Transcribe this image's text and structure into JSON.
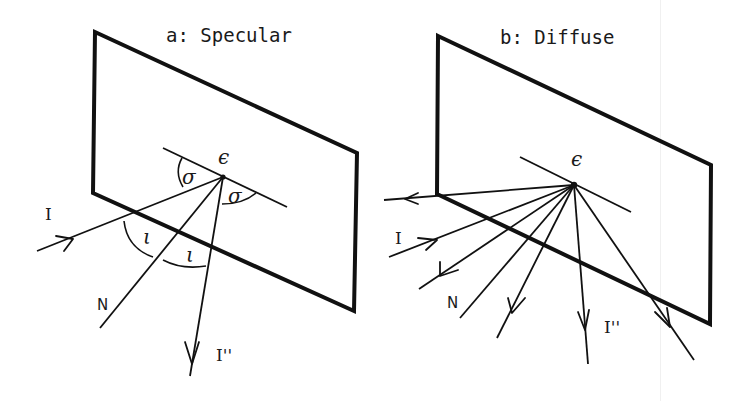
{
  "figure": {
    "panels": [
      {
        "id": "a",
        "title": "a:  Specular",
        "labels": {
          "incident": "I",
          "normal": "N",
          "reflected": "I''",
          "surface_point": "ϵ",
          "angle_sigma": "σ",
          "angle_iota": "ι"
        }
      },
      {
        "id": "b",
        "title": "b:  Diffuse",
        "labels": {
          "incident": "I",
          "normal": "N",
          "reflected": "I''",
          "surface_point": "ϵ"
        }
      }
    ],
    "colors": {
      "ink": "#111111",
      "background": "#ffffff"
    }
  }
}
